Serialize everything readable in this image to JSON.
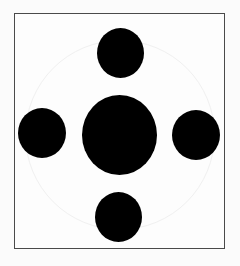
{
  "diagram": {
    "frame": {
      "x": 14,
      "y": 13,
      "width": 211,
      "height": 236,
      "border_color": "#4a4a4a"
    },
    "guide_circle": {
      "cx": 120,
      "cy": 135,
      "r": 95,
      "color": "#f0f0f0"
    },
    "circles": [
      {
        "id": "top",
        "cx": 120,
        "cy": 53,
        "w": 47,
        "h": 50,
        "color": "#000000"
      },
      {
        "id": "left",
        "cx": 42,
        "cy": 133,
        "w": 48,
        "h": 50,
        "color": "#000000"
      },
      {
        "id": "center",
        "cx": 120,
        "cy": 135,
        "w": 75,
        "h": 80,
        "color": "#000000"
      },
      {
        "id": "right",
        "cx": 196,
        "cy": 135,
        "w": 48,
        "h": 50,
        "color": "#000000"
      },
      {
        "id": "bottom",
        "cx": 118,
        "cy": 217,
        "w": 47,
        "h": 50,
        "color": "#000000"
      }
    ]
  }
}
